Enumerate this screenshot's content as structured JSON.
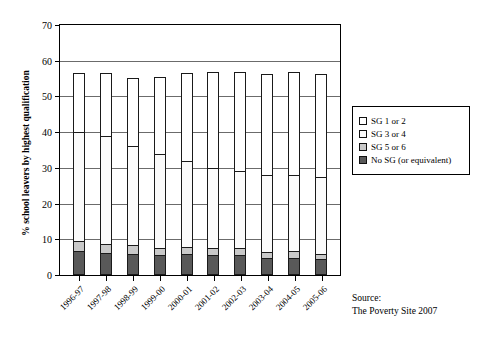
{
  "chart_data": {
    "type": "bar",
    "subtype": "stacked-vertical",
    "title": "",
    "xlabel": "",
    "ylabel": "% school leavers by highest qualification",
    "ylim": [
      0,
      70
    ],
    "yticks": [
      0,
      10,
      20,
      30,
      40,
      50,
      60,
      70
    ],
    "grid": true,
    "legend_position": "right",
    "categories": [
      "1996-97",
      "1997-98",
      "1998-99",
      "1999-00",
      "2000-01",
      "2001-02",
      "2002-03",
      "2003-04",
      "2004-05",
      "2005-06"
    ],
    "stack_order_bottom_to_top": [
      "No SG (or equivalent)",
      "SG 5 or 6",
      "SG 3 or 4",
      "SG 1 or 2"
    ],
    "series": [
      {
        "name": "No SG (or equivalent)",
        "color": "#595959",
        "values": [
          6.7,
          6.1,
          5.9,
          5.6,
          5.9,
          5.7,
          5.5,
          4.8,
          4.9,
          4.5
        ]
      },
      {
        "name": "SG 5 or 6",
        "color": "#c9c9c9",
        "values": [
          3.1,
          2.8,
          2.8,
          2.2,
          2.3,
          2.2,
          2.3,
          1.8,
          2.1,
          1.8
        ]
      },
      {
        "name": "SG 3 or 4",
        "color": "#fbfbfb",
        "values": [
          30.7,
          30.5,
          28.1,
          26.6,
          24.2,
          22.7,
          22.0,
          21.9,
          21.5,
          21.6
        ]
      },
      {
        "name": "SG 1 or 2",
        "color": "#ffffff",
        "values": [
          17.0,
          17.9,
          19.3,
          21.8,
          25.0,
          27.1,
          27.9,
          28.7,
          29.2,
          29.3
        ]
      }
    ],
    "cumulative_tops": {
      "No SG (or equivalent)": [
        6.7,
        6.1,
        5.9,
        5.6,
        5.9,
        5.7,
        5.5,
        4.8,
        4.9,
        4.5
      ],
      "SG 5 or 6": [
        9.8,
        8.9,
        8.7,
        7.8,
        8.2,
        7.9,
        7.8,
        6.6,
        7.0,
        6.3
      ],
      "SG 3 or 4": [
        40.5,
        39.4,
        36.8,
        34.4,
        32.4,
        30.6,
        29.8,
        28.5,
        28.5,
        27.9
      ],
      "SG 1 or 2": [
        57.5,
        57.3,
        56.1,
        56.2,
        57.4,
        57.7,
        57.7,
        57.2,
        57.7,
        57.2
      ]
    },
    "totals": [
      57.5,
      57.3,
      56.1,
      56.2,
      57.4,
      57.7,
      57.7,
      57.2,
      57.7,
      57.2
    ]
  },
  "legend": {
    "items": [
      {
        "label": "SG 1 or 2",
        "swatch": "sg12"
      },
      {
        "label": "SG 3 or 4",
        "swatch": "sg34"
      },
      {
        "label": "SG 5 or 6",
        "swatch": "sg56"
      },
      {
        "label": "No SG (or equivalent)",
        "swatch": "nosg"
      }
    ]
  },
  "source": {
    "line1": "Source:",
    "line2": "The Poverty Site 2007"
  }
}
